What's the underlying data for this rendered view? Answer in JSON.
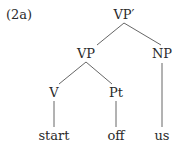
{
  "label": "(2a)",
  "tree": {
    "root": "VP′",
    "nodes": {
      "vp": "VP",
      "np": "NP",
      "v": "V",
      "pt": "Pt"
    },
    "leaves": {
      "start": "start",
      "off": "off",
      "us": "us"
    }
  },
  "colors": {
    "text": "#2a2a2a",
    "edge": "#555555",
    "background": "#ffffff"
  }
}
